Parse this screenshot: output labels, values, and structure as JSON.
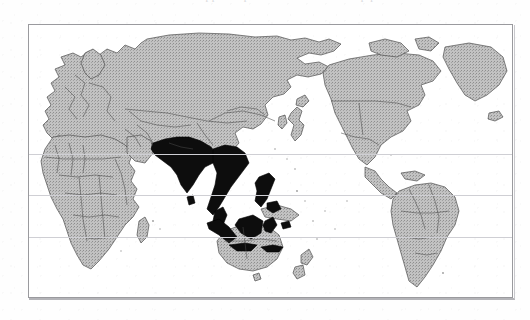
{
  "figure": {
    "kind": "world-map",
    "projection": "cylindrical",
    "caption_ghost": "remnant of clipped caption text above the map plate",
    "frame": {
      "border_color": "#9a9a9e",
      "background_color": "#ffffff",
      "x": 28,
      "y": 24,
      "width": 485,
      "height": 274
    }
  },
  "legend": {
    "highlight_label": "South and Southeast Asia (highlighted)",
    "highlight_color": "#0d0d0d",
    "land_label": "Other land areas",
    "land_color": "#b9b9b9",
    "ocean_label": "Ocean",
    "ocean_color": "#ffffff",
    "border_label": "Country borders",
    "border_color": "#4a4a4a"
  },
  "graticule": {
    "line_color": "#cfcfd4",
    "lines": [
      {
        "name": "tropic-of-cancer",
        "label": "Tropic of Cancer",
        "y": 129
      },
      {
        "name": "equator",
        "label": "Equator",
        "y": 170
      },
      {
        "name": "tropic-of-capricorn",
        "label": "Tropic of Capricorn",
        "y": 212
      }
    ]
  },
  "regions": {
    "highlighted": [
      "India",
      "Pakistan",
      "Bangladesh",
      "Sri Lanka",
      "Nepal",
      "Myanmar",
      "Thailand",
      "Laos",
      "Cambodia",
      "Vietnam",
      "Malaysia",
      "Indonesia",
      "Philippines"
    ],
    "shaded": [
      "Russia",
      "China",
      "Mongolia",
      "Kazakhstan",
      "Japan",
      "Korea",
      "Europe",
      "Africa",
      "Middle East",
      "Australia",
      "New Zealand",
      "Papua New Guinea",
      "North America",
      "Greenland",
      "Central America",
      "South America"
    ]
  }
}
